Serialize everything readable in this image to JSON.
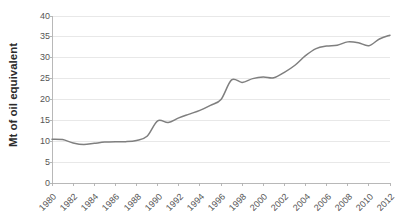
{
  "chart_data": {
    "type": "line",
    "title": "",
    "subtitle": "",
    "xlabel": "",
    "ylabel": "Mt of oil equivalent",
    "ylim": [
      0,
      40
    ],
    "xlim": [
      1980,
      2012
    ],
    "y_ticks": [
      0,
      5,
      10,
      15,
      20,
      25,
      30,
      35,
      40
    ],
    "y_tick_labels": [
      "0",
      "5",
      "10",
      "15",
      "20",
      "25",
      "30",
      "35",
      "40"
    ],
    "x_tick_labels": [
      "1980",
      "1982",
      "1984",
      "1986",
      "1988",
      "1990",
      "1992",
      "1994",
      "1996",
      "1998",
      "2000",
      "2002",
      "2004",
      "2006",
      "2008",
      "2010",
      "2012"
    ],
    "grid": "horizontal",
    "legend": "none",
    "line_color": "#7f7f7f",
    "gridline_color": "#e2e2e2",
    "axis_color": "#b0b0b0",
    "series": [
      {
        "name": "Energy consumption",
        "x": [
          1980,
          1981,
          1982,
          1983,
          1984,
          1985,
          1986,
          1987,
          1988,
          1989,
          1990,
          1991,
          1992,
          1993,
          1994,
          1995,
          1996,
          1997,
          1998,
          1999,
          2000,
          2001,
          2002,
          2003,
          2004,
          2005,
          2006,
          2007,
          2008,
          2009,
          2010,
          2011,
          2012
        ],
        "values": [
          10.5,
          10.4,
          9.6,
          9.2,
          9.5,
          9.8,
          9.9,
          9.9,
          10.2,
          11.2,
          14.9,
          14.5,
          15.6,
          16.5,
          17.4,
          18.6,
          20.0,
          24.7,
          24.1,
          25.0,
          25.4,
          25.2,
          26.5,
          28.2,
          30.5,
          32.2,
          32.8,
          33.0,
          33.8,
          33.6,
          32.9,
          34.5,
          35.4
        ]
      }
    ]
  }
}
